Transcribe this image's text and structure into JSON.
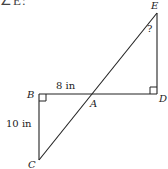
{
  "figure": {
    "top_fragment": "∠E:",
    "points": {
      "A": {
        "label": "A",
        "x": 92,
        "y": 94
      },
      "B": {
        "label": "B",
        "x": 39,
        "y": 94
      },
      "C": {
        "label": "C",
        "x": 39,
        "y": 160
      },
      "D": {
        "label": "D",
        "x": 157,
        "y": 94
      },
      "E": {
        "label": "E",
        "x": 157,
        "y": 13
      }
    },
    "measurements": {
      "AB": "8 in",
      "BC": "10 in",
      "angle_E": "?"
    },
    "right_angles": [
      "B",
      "D"
    ],
    "stroke_color": "#222222"
  }
}
